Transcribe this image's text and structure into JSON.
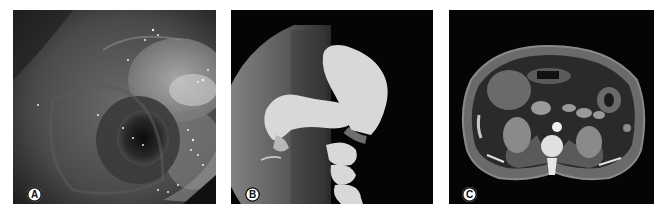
{
  "figure": {
    "panels": [
      {
        "id": "A",
        "label": "A",
        "modality": "endoscopy",
        "description": "Endoscopic view of lumen"
      },
      {
        "id": "B",
        "label": "B",
        "modality": "barium-enema",
        "description": "Contrast radiograph of colon"
      },
      {
        "id": "C",
        "label": "C",
        "modality": "ct-axial",
        "description": "Axial abdominal CT slice"
      }
    ]
  }
}
